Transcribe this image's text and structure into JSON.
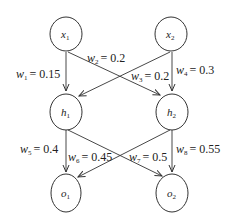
{
  "diagram": {
    "type": "neural-network",
    "layers": [
      {
        "name": "input",
        "nodes": [
          {
            "id": "x1",
            "base": "x",
            "sub": "1"
          },
          {
            "id": "x2",
            "base": "x",
            "sub": "2"
          }
        ]
      },
      {
        "name": "hidden",
        "nodes": [
          {
            "id": "h1",
            "base": "h",
            "sub": "1"
          },
          {
            "id": "h2",
            "base": "h",
            "sub": "2"
          }
        ]
      },
      {
        "name": "output",
        "nodes": [
          {
            "id": "o1",
            "base": "o",
            "sub": "1"
          },
          {
            "id": "o2",
            "base": "o",
            "sub": "2"
          }
        ]
      }
    ],
    "nodes": {
      "x1": {
        "base": "x",
        "sub": "1"
      },
      "x2": {
        "base": "x",
        "sub": "2"
      },
      "h1": {
        "base": "h",
        "sub": "1"
      },
      "h2": {
        "base": "h",
        "sub": "2"
      },
      "o1": {
        "base": "o",
        "sub": "1"
      },
      "o2": {
        "base": "o",
        "sub": "2"
      }
    },
    "edges": [
      {
        "from": "x1",
        "to": "h1",
        "w": "w",
        "sub": "1",
        "value": "= 0.15"
      },
      {
        "from": "x1",
        "to": "h2",
        "w": "w",
        "sub": "2",
        "value": "= 0.2"
      },
      {
        "from": "x2",
        "to": "h1",
        "w": "w",
        "sub": "3",
        "value": "= 0.2"
      },
      {
        "from": "x2",
        "to": "h2",
        "w": "w",
        "sub": "4",
        "value": "= 0.3"
      },
      {
        "from": "h1",
        "to": "o1",
        "w": "w",
        "sub": "5",
        "value": "= 0.4"
      },
      {
        "from": "h1",
        "to": "o2",
        "w": "w",
        "sub": "6",
        "value": "= 0.45"
      },
      {
        "from": "h2",
        "to": "o1",
        "w": "w",
        "sub": "7",
        "value": "= 0.5"
      },
      {
        "from": "h2",
        "to": "o2",
        "w": "w",
        "sub": "8",
        "value": "= 0.55"
      }
    ]
  }
}
